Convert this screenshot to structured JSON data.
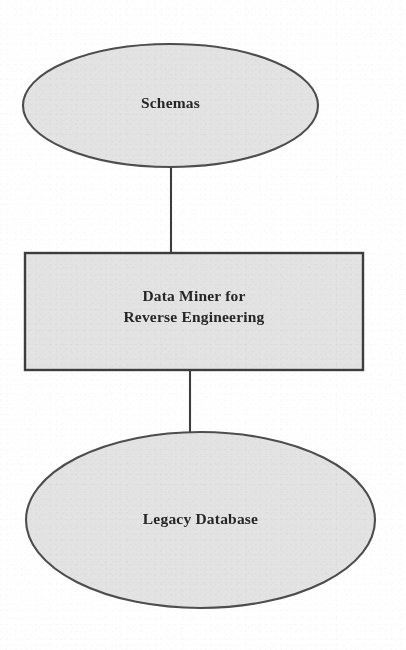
{
  "diagram": {
    "type": "flow-diagram",
    "orientation": "vertical",
    "title": "",
    "nodes": [
      {
        "id": "schemas",
        "label": "Schemas",
        "shape": "ellipse",
        "fill": "#e2e2e2",
        "stroke": "#4d4d4d",
        "cx": 170.5,
        "cy": 105.5,
        "rx": 147.5,
        "ry": 61.5
      },
      {
        "id": "data-miner",
        "label": "Data Miner for\nReverse Engineering",
        "shape": "rectangle",
        "fill": "#e2e2e2",
        "stroke": "#3d3d3d",
        "x": 25,
        "y": 253,
        "width": 338,
        "height": 117
      },
      {
        "id": "legacy-database",
        "label": "Legacy Database",
        "shape": "ellipse",
        "fill": "#e2e2e2",
        "stroke": "#4d4d4d",
        "cx": 200.5,
        "cy": 520,
        "rx": 174.5,
        "ry": 88
      }
    ],
    "connectors": [
      {
        "id": "schemas-to-data-miner",
        "from": "schemas",
        "to": "data-miner",
        "style": "solid-line",
        "stroke": "#3d3d3d",
        "x1": 171,
        "y1": 167,
        "x2": 171,
        "y2": 253
      },
      {
        "id": "data-miner-to-legacy-database",
        "from": "data-miner",
        "to": "legacy-database",
        "style": "solid-line",
        "stroke": "#3d3d3d",
        "x1": 190,
        "y1": 370,
        "x2": 190,
        "y2": 432
      }
    ]
  }
}
